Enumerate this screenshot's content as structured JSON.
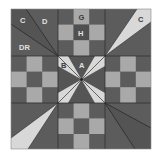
{
  "diagram": {
    "colors": {
      "dark": "#5c5c5c",
      "darker": "#4e4e4e",
      "light": "#a9a9a9",
      "lightest": "#d8d8d8",
      "line": "#2a2a2a",
      "background": "#ffffff"
    },
    "labels": {
      "c_top_left": "C",
      "d": "D",
      "dr": "DR",
      "g": "G",
      "h": "H",
      "c_top_right": "C",
      "b": "B",
      "a": "A"
    },
    "nine_patch_pattern": [
      [
        "dark",
        "light",
        "dark"
      ],
      [
        "light",
        "dark",
        "light"
      ],
      [
        "dark",
        "light",
        "dark"
      ]
    ],
    "units": {
      "top_left": "corner pieced: C, D, DR sections",
      "top_center": "nine-patch",
      "top_right": "corner with light C wedge",
      "middle_left": "nine-patch",
      "center": "star X: A dark background, B light wedges",
      "middle_right": "nine-patch",
      "bottom_left": "corner with light wedge",
      "bottom_center": "nine-patch",
      "bottom_right": "corner pieced wedges"
    }
  }
}
